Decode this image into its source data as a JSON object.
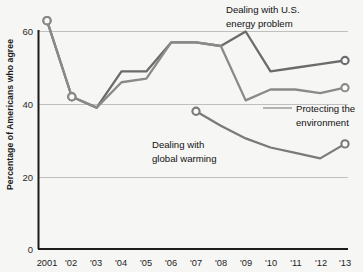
{
  "chart_data": {
    "type": "line",
    "title": "",
    "xlabel": "",
    "ylabel": "Percentage of Americans who agree",
    "ylim": [
      0,
      68
    ],
    "yticks": [
      0,
      20,
      40,
      60
    ],
    "ytick_labels": [
      "0",
      "20",
      "40",
      "60"
    ],
    "grid": "horizontal",
    "legend_position": "inline-annotations",
    "categories": [
      "2001",
      "'02",
      "'03",
      "'04",
      "'05",
      "'06",
      "'07",
      "'08",
      "'09",
      "'10",
      "'11",
      "'12",
      "'13"
    ],
    "x": [
      2001,
      2002,
      2003,
      2004,
      2005,
      2006,
      2007,
      2008,
      2009,
      2010,
      2011,
      2012,
      2013
    ],
    "series": [
      {
        "name": "Dealing with U.S. energy problem",
        "color": "#6b6b6b",
        "values": [
          63,
          42,
          39,
          49,
          49,
          57,
          57,
          56,
          60,
          49,
          50,
          51,
          52
        ],
        "marker_years": [
          "2001",
          "'02",
          "'13"
        ]
      },
      {
        "name": "Protecting the environment",
        "color": "#8a8a8a",
        "values": [
          63,
          42,
          39,
          46,
          47,
          57,
          57,
          56,
          41,
          44,
          44,
          43,
          44.5
        ],
        "marker_years": [
          "2001",
          "'02",
          "'13"
        ]
      },
      {
        "name": "Dealing with global warming",
        "color": "#7a7a7a",
        "values": [
          null,
          null,
          null,
          null,
          null,
          null,
          38,
          34,
          30.5,
          28,
          26.5,
          25,
          29
        ],
        "marker_years": [
          "'07",
          "'13"
        ]
      }
    ],
    "annotations": [
      {
        "id": "energy",
        "line1": "Dealing with U.S.",
        "line2": "energy problem"
      },
      {
        "id": "environment",
        "line1": "Protecting the",
        "line2": "environment"
      },
      {
        "id": "warming",
        "line1": "Dealing with",
        "line2": "global warming"
      }
    ]
  }
}
